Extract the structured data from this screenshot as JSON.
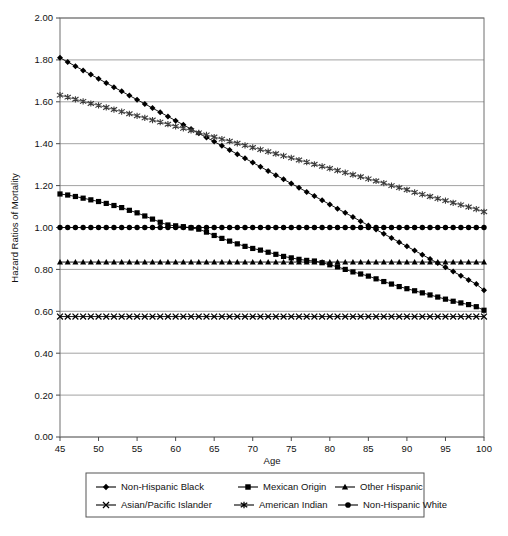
{
  "chart_data": {
    "type": "line",
    "title": "",
    "xlabel": "Age",
    "ylabel": "Hazard Ratios of Mortality",
    "xlim": [
      45,
      100
    ],
    "ylim": [
      0.0,
      2.0
    ],
    "grid": true,
    "legend_position": "bottom",
    "x_ticks": [
      "45",
      "50",
      "55",
      "60",
      "65",
      "70",
      "75",
      "80",
      "85",
      "90",
      "95",
      "100"
    ],
    "y_ticks": [
      "0.00",
      "0.20",
      "0.40",
      "0.60",
      "0.80",
      "1.00",
      "1.20",
      "1.40",
      "1.60",
      "1.80",
      "2.00"
    ],
    "x": [
      45,
      46,
      47,
      48,
      49,
      50,
      51,
      52,
      53,
      54,
      55,
      56,
      57,
      58,
      59,
      60,
      61,
      62,
      63,
      64,
      65,
      66,
      67,
      68,
      69,
      70,
      71,
      72,
      73,
      74,
      75,
      76,
      77,
      78,
      79,
      80,
      81,
      82,
      83,
      84,
      85,
      86,
      87,
      88,
      89,
      90,
      91,
      92,
      93,
      94,
      95,
      96,
      97,
      98,
      99,
      100
    ],
    "series": [
      {
        "name": "Non-Hispanic Black",
        "marker": "diamond",
        "color": "#000000",
        "values": [
          1.81,
          1.79,
          1.77,
          1.75,
          1.73,
          1.71,
          1.69,
          1.67,
          1.65,
          1.63,
          1.61,
          1.59,
          1.57,
          1.55,
          1.53,
          1.51,
          1.49,
          1.47,
          1.45,
          1.43,
          1.41,
          1.39,
          1.37,
          1.35,
          1.33,
          1.31,
          1.29,
          1.27,
          1.25,
          1.23,
          1.21,
          1.19,
          1.17,
          1.15,
          1.13,
          1.11,
          1.09,
          1.07,
          1.05,
          1.03,
          1.01,
          0.99,
          0.97,
          0.95,
          0.93,
          0.91,
          0.89,
          0.87,
          0.85,
          0.83,
          0.81,
          0.79,
          0.77,
          0.75,
          0.73,
          0.7
        ]
      },
      {
        "name": "Mexican Origin",
        "marker": "square",
        "color": "#000000",
        "values": [
          1.16,
          1.155,
          1.148,
          1.14,
          1.132,
          1.124,
          1.115,
          1.105,
          1.095,
          1.082,
          1.07,
          1.055,
          1.04,
          1.025,
          1.012,
          1.008,
          1.004,
          0.998,
          0.992,
          0.978,
          0.962,
          0.948,
          0.935,
          0.922,
          0.91,
          0.9,
          0.892,
          0.882,
          0.872,
          0.862,
          0.855,
          0.848,
          0.843,
          0.84,
          0.832,
          0.822,
          0.812,
          0.8,
          0.788,
          0.778,
          0.768,
          0.755,
          0.742,
          0.73,
          0.718,
          0.708,
          0.698,
          0.688,
          0.678,
          0.668,
          0.658,
          0.648,
          0.64,
          0.632,
          0.622,
          0.605
        ]
      },
      {
        "name": "Other Hispanic",
        "marker": "triangle",
        "color": "#000000",
        "values": [
          0.835,
          0.835,
          0.835,
          0.835,
          0.835,
          0.835,
          0.835,
          0.835,
          0.835,
          0.835,
          0.835,
          0.835,
          0.835,
          0.835,
          0.835,
          0.835,
          0.835,
          0.835,
          0.835,
          0.835,
          0.835,
          0.835,
          0.835,
          0.835,
          0.835,
          0.835,
          0.835,
          0.835,
          0.835,
          0.835,
          0.835,
          0.835,
          0.835,
          0.835,
          0.835,
          0.835,
          0.835,
          0.835,
          0.835,
          0.835,
          0.835,
          0.835,
          0.835,
          0.835,
          0.835,
          0.835,
          0.835,
          0.835,
          0.835,
          0.835,
          0.835,
          0.835,
          0.835,
          0.835,
          0.835,
          0.835
        ]
      },
      {
        "name": "Asian/Pacific Islander",
        "marker": "cross-x",
        "color": "#000000",
        "values": [
          0.575,
          0.575,
          0.575,
          0.575,
          0.575,
          0.575,
          0.575,
          0.575,
          0.575,
          0.575,
          0.575,
          0.575,
          0.575,
          0.575,
          0.575,
          0.575,
          0.575,
          0.575,
          0.575,
          0.575,
          0.575,
          0.575,
          0.575,
          0.575,
          0.575,
          0.575,
          0.575,
          0.575,
          0.575,
          0.575,
          0.575,
          0.575,
          0.575,
          0.575,
          0.575,
          0.575,
          0.575,
          0.575,
          0.575,
          0.575,
          0.575,
          0.575,
          0.575,
          0.575,
          0.575,
          0.575,
          0.575,
          0.575,
          0.575,
          0.575,
          0.575,
          0.575,
          0.575,
          0.575,
          0.575,
          0.575
        ]
      },
      {
        "name": "American Indian",
        "marker": "asterisk",
        "color": "#3a3a3a",
        "values": [
          1.632,
          1.622,
          1.612,
          1.602,
          1.592,
          1.583,
          1.573,
          1.563,
          1.553,
          1.543,
          1.533,
          1.523,
          1.513,
          1.503,
          1.493,
          1.483,
          1.473,
          1.463,
          1.452,
          1.442,
          1.432,
          1.422,
          1.412,
          1.402,
          1.392,
          1.382,
          1.372,
          1.362,
          1.352,
          1.342,
          1.332,
          1.322,
          1.312,
          1.302,
          1.292,
          1.282,
          1.272,
          1.262,
          1.252,
          1.242,
          1.232,
          1.222,
          1.212,
          1.2,
          1.19,
          1.18,
          1.168,
          1.158,
          1.148,
          1.138,
          1.128,
          1.118,
          1.108,
          1.098,
          1.088,
          1.075
        ]
      },
      {
        "name": "Non-Hispanic White",
        "marker": "circle",
        "color": "#000000",
        "values": [
          1.0,
          1.0,
          1.0,
          1.0,
          1.0,
          1.0,
          1.0,
          1.0,
          1.0,
          1.0,
          1.0,
          1.0,
          1.0,
          1.0,
          1.0,
          1.0,
          1.0,
          1.0,
          1.0,
          1.0,
          1.0,
          1.0,
          1.0,
          1.0,
          1.0,
          1.0,
          1.0,
          1.0,
          1.0,
          1.0,
          1.0,
          1.0,
          1.0,
          1.0,
          1.0,
          1.0,
          1.0,
          1.0,
          1.0,
          1.0,
          1.0,
          1.0,
          1.0,
          1.0,
          1.0,
          1.0,
          1.0,
          1.0,
          1.0,
          1.0,
          1.0,
          1.0,
          1.0,
          1.0,
          1.0,
          1.0
        ]
      }
    ]
  },
  "legend": {
    "row1": [
      {
        "label": "Non-Hispanic Black",
        "marker": "diamond"
      },
      {
        "label": "Mexican Origin",
        "marker": "square"
      },
      {
        "label": "Other Hispanic",
        "marker": "triangle"
      }
    ],
    "row2": [
      {
        "label": "Asian/Pacific Islander",
        "marker": "cross-x"
      },
      {
        "label": "American Indian",
        "marker": "asterisk"
      },
      {
        "label": "Non-Hispanic White",
        "marker": "circle"
      }
    ]
  }
}
